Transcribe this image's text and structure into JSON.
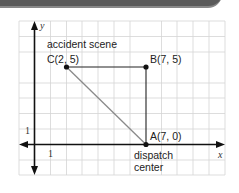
{
  "diagram": {
    "type": "coordinate-grid",
    "axes": {
      "x_label": "x",
      "y_label": "y",
      "x_tick_label": "1",
      "y_tick_label": "1"
    },
    "grid": {
      "x_range": [
        -1,
        12
      ],
      "y_range": [
        -2,
        8
      ],
      "unit": 1
    },
    "points": [
      {
        "id": "C",
        "label": "C(2, 5)",
        "x": 2,
        "y": 5,
        "caption": "accident scene"
      },
      {
        "id": "B",
        "label": "B(7, 5)",
        "x": 7,
        "y": 5,
        "caption": ""
      },
      {
        "id": "A",
        "label": "A(7, 0)",
        "x": 7,
        "y": 0,
        "caption_line1": "dispatch",
        "caption_line2": "center"
      }
    ],
    "segments": [
      {
        "from": "C",
        "to": "B",
        "color": "#222222"
      },
      {
        "from": "B",
        "to": "A",
        "color": "#222222"
      },
      {
        "from": "C",
        "to": "A",
        "color": "#888888"
      }
    ],
    "labels": {
      "accident": "accident scene",
      "C": "C(2, 5)",
      "B": "B(7, 5)",
      "A": "A(7, 0)",
      "dispatch": "dispatch",
      "center": "center",
      "x": "x",
      "y": "y",
      "one_x": "1",
      "one_y": "1"
    }
  }
}
